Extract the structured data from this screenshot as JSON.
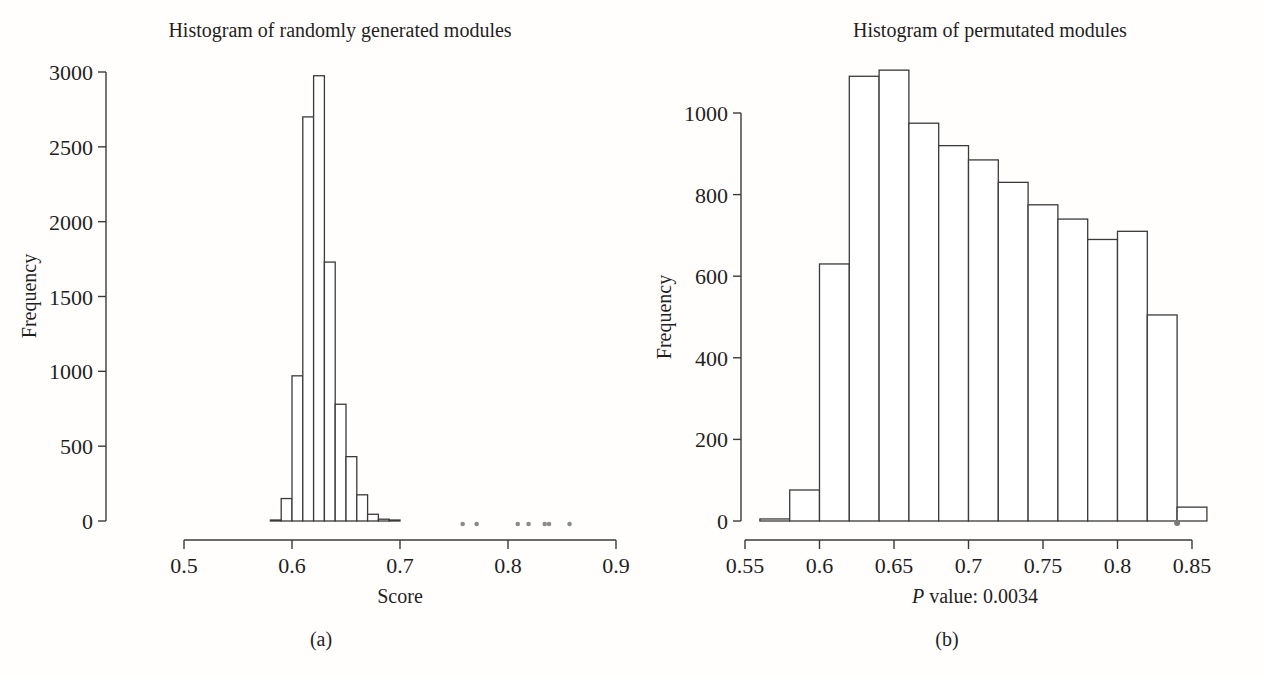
{
  "figure": {
    "background": "#fffefc",
    "ink": "#3a3a3a",
    "text_color": "#1f1f1f",
    "dot_color": "#8b8b8b",
    "bar_fill": "#ffffff"
  },
  "chart_data": [
    {
      "id": "panel-a",
      "type": "bar",
      "subtype": "histogram",
      "title": "Histogram of randomly generated modules",
      "xlabel": "Score",
      "ylabel": "Frequency",
      "caption": "(a)",
      "xlim": [
        0.5,
        0.9
      ],
      "ylim": [
        0,
        3000
      ],
      "x_ticks": [
        0.5,
        0.6,
        0.7,
        0.8,
        0.9
      ],
      "x_tick_labels": [
        "0.5",
        "0.6",
        "0.7",
        "0.8",
        "0.9"
      ],
      "y_ticks": [
        0,
        500,
        1000,
        1500,
        2000,
        2500,
        3000
      ],
      "y_tick_labels": [
        "0",
        "500",
        "1000",
        "1500",
        "2000",
        "2500",
        "3000"
      ],
      "bin_start": 0.58,
      "bin_width": 0.01,
      "counts": [
        5,
        150,
        970,
        2700,
        2975,
        1730,
        780,
        430,
        175,
        45,
        12,
        5
      ],
      "outlier_dots_x": [
        0.758,
        0.771,
        0.809,
        0.819,
        0.834,
        0.838,
        0.857
      ],
      "grid": false,
      "legend": false
    },
    {
      "id": "panel-b",
      "type": "bar",
      "subtype": "histogram",
      "title": "Histogram of permutated modules",
      "xlabel_italic_prefix": "P",
      "xlabel_rest": " value: 0.0034",
      "ylabel": "Frequency",
      "caption": "(b)",
      "xlim": [
        0.55,
        0.85
      ],
      "ylim": [
        0,
        1000
      ],
      "x_ticks": [
        0.55,
        0.6,
        0.65,
        0.7,
        0.75,
        0.8,
        0.85
      ],
      "x_tick_labels": [
        "0.55",
        "0.6",
        "0.65",
        "0.7",
        "0.75",
        "0.8",
        "0.85"
      ],
      "y_ticks": [
        0,
        200,
        400,
        600,
        800,
        1000
      ],
      "y_tick_labels": [
        "0",
        "200",
        "400",
        "600",
        "800",
        "1000"
      ],
      "bin_start": 0.56,
      "bin_width": 0.02,
      "counts": [
        5,
        76,
        630,
        1090,
        1105,
        975,
        920,
        885,
        830,
        775,
        740,
        690,
        710,
        505,
        34
      ],
      "observed_dot_x": 0.84,
      "grid": false,
      "legend": false
    }
  ]
}
